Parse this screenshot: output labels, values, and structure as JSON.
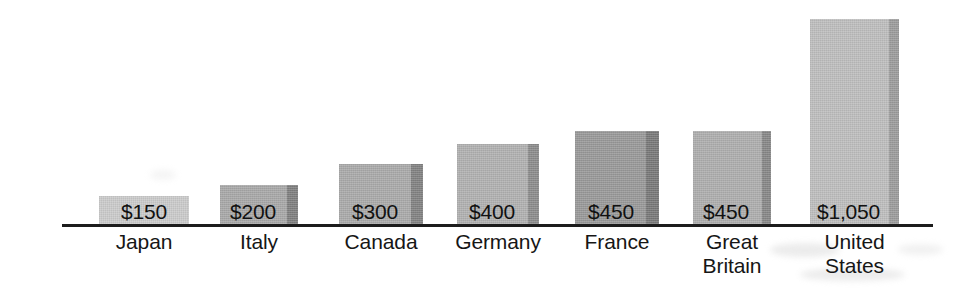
{
  "chart_data": {
    "type": "bar",
    "title": "",
    "subtitle": "",
    "xlabel": "",
    "ylabel": "",
    "grid": false,
    "legend": "none",
    "axis": {
      "baseline_shown": true,
      "y_axis_shown": false,
      "ylim": [
        0,
        1200
      ]
    },
    "categories": [
      "Japan",
      "Italy",
      "Canada",
      "Germany",
      "France",
      "Great Britain",
      "United States"
    ],
    "values": [
      150,
      200,
      300,
      400,
      450,
      450,
      1050
    ],
    "value_labels": [
      "$150",
      "$200",
      "$300",
      "$400",
      "$450",
      "$450",
      "$1,050"
    ],
    "currency": "USD",
    "bars": [
      {
        "category": "Japan",
        "label_lines": "Japan",
        "value": 150,
        "value_label": "$150",
        "x": 99,
        "width": 90,
        "top": 196,
        "height": 30,
        "face_color": "#c9c9c9",
        "side_color": "#b2b2b2",
        "side_width": 0
      },
      {
        "category": "Italy",
        "label_lines": "Italy",
        "value": 200,
        "value_label": "$200",
        "x": 220,
        "width": 78,
        "top": 185,
        "height": 41,
        "face_color": "#a6a6a6",
        "side_color": "#7d7d7d",
        "side_width": 11
      },
      {
        "category": "Canada",
        "label_lines": "Canada",
        "value": 300,
        "value_label": "$300",
        "x": 339,
        "width": 84,
        "top": 164,
        "height": 62,
        "face_color": "#a8a8a8",
        "side_color": "#808080",
        "side_width": 12
      },
      {
        "category": "Germany",
        "label_lines": "Germany",
        "value": 400,
        "value_label": "$400",
        "x": 457,
        "width": 82,
        "top": 144,
        "height": 82,
        "face_color": "#afafaf",
        "side_color": "#8a8a8a",
        "side_width": 11
      },
      {
        "category": "France",
        "label_lines": "France",
        "value": 450,
        "value_label": "$450",
        "x": 575,
        "width": 84,
        "top": 131,
        "height": 95,
        "face_color": "#979797",
        "side_color": "#777777",
        "side_width": 13
      },
      {
        "category": "Great Britain",
        "label_lines": "Great\nBritain",
        "value": 450,
        "value_label": "$450",
        "x": 693,
        "width": 78,
        "top": 131,
        "height": 95,
        "face_color": "#acacac",
        "side_color": "#858585",
        "side_width": 9
      },
      {
        "category": "United States",
        "label_lines": "United\nStates",
        "value": 1050,
        "value_label": "$1,050",
        "x": 810,
        "width": 89,
        "top": 19,
        "height": 207,
        "face_color": "#bcbcbc",
        "side_color": "#9a9a9a",
        "side_width": 10
      }
    ],
    "colors": {
      "background": "#ffffff",
      "axis": "#1c1c1c",
      "text": "#161616"
    }
  }
}
